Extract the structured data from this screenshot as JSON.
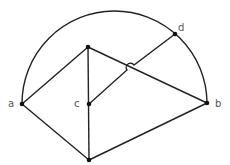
{
  "diagram": {
    "labels": {
      "a": "a",
      "b": "b",
      "c": "c",
      "d": "d"
    },
    "colors": {
      "stroke": "#222222",
      "label": "#555555",
      "background": "#ffffff"
    },
    "nodes": [
      {
        "id": "a",
        "x": 22,
        "y": 104,
        "label": "a"
      },
      {
        "id": "b",
        "x": 207,
        "y": 103,
        "label": "b"
      },
      {
        "id": "c",
        "x": 89,
        "y": 104,
        "label": "c"
      },
      {
        "id": "d",
        "x": 175,
        "y": 34,
        "label": "d"
      },
      {
        "id": "top",
        "x": 88,
        "y": 47,
        "label": ""
      },
      {
        "id": "bottom",
        "x": 89,
        "y": 160,
        "label": ""
      }
    ],
    "edges": [
      [
        "a",
        "top"
      ],
      [
        "top",
        "b"
      ],
      [
        "top",
        "bottom"
      ],
      [
        "a",
        "bottom"
      ],
      [
        "bottom",
        "b"
      ],
      [
        "c",
        "d"
      ]
    ],
    "arc": {
      "from": "a",
      "to": "b",
      "type": "semicircle"
    }
  }
}
